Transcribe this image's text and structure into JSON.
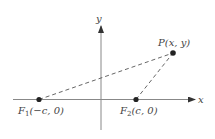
{
  "diagram": {
    "axes": {
      "x_label": "x",
      "y_label": "y"
    },
    "points": {
      "F1": {
        "name": "F",
        "sub": "1",
        "coords": "(−c, 0)"
      },
      "F2": {
        "name": "F",
        "sub": "2",
        "coords": "(c, 0)"
      },
      "P": {
        "name": "P",
        "coords": "(x, y)"
      }
    },
    "colors": {
      "axis": "#777777",
      "dash": "#555555",
      "dot": "#222222",
      "text": "#444444"
    }
  }
}
